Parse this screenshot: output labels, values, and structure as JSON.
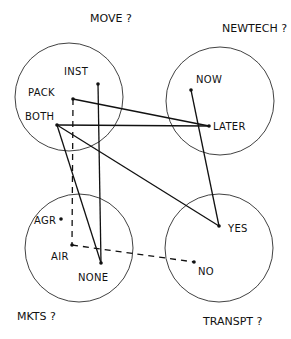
{
  "diagram": {
    "type": "hand-drawn-venn-network",
    "ink_color": "#111111",
    "background": "#ffffff",
    "groups": [
      {
        "id": "move",
        "title": "MOVE ?",
        "cx": 69,
        "cy": 97,
        "r": 54,
        "title_x": 90,
        "title_y": 22
      },
      {
        "id": "newtech",
        "title": "NEWTECH ?",
        "cx": 220,
        "cy": 101,
        "r": 54,
        "title_x": 222,
        "title_y": 32
      },
      {
        "id": "mkts",
        "title": "MKTS ?",
        "cx": 79,
        "cy": 248,
        "r": 54,
        "title_x": 17,
        "title_y": 320
      },
      {
        "id": "transpt",
        "title": "TRANSPT ?",
        "cx": 219,
        "cy": 248,
        "r": 54,
        "title_x": 203,
        "title_y": 325
      }
    ],
    "nodes": [
      {
        "id": "inst",
        "label": "INST",
        "x": 98,
        "y": 84,
        "lx": 64,
        "ly": 75,
        "group": "move"
      },
      {
        "id": "pack",
        "label": "PACK",
        "x": 73,
        "y": 99,
        "lx": 28,
        "ly": 96,
        "group": "move"
      },
      {
        "id": "both",
        "label": "BOTH",
        "x": 57,
        "y": 125,
        "lx": 25,
        "ly": 120,
        "group": "move"
      },
      {
        "id": "now",
        "label": "NOW",
        "x": 191,
        "y": 90,
        "lx": 196,
        "ly": 83,
        "group": "newtech"
      },
      {
        "id": "later",
        "label": "LATER",
        "x": 209,
        "y": 126,
        "lx": 213,
        "ly": 130,
        "group": "newtech"
      },
      {
        "id": "agr",
        "label": "AGR",
        "x": 61,
        "y": 219,
        "lx": 34,
        "ly": 224,
        "group": "mkts"
      },
      {
        "id": "air",
        "label": "AIR",
        "x": 72,
        "y": 245,
        "lx": 51,
        "ly": 260,
        "group": "mkts"
      },
      {
        "id": "none",
        "label": "NONE",
        "x": 101,
        "y": 263,
        "lx": 78,
        "ly": 281,
        "group": "mkts"
      },
      {
        "id": "yes",
        "label": "YES",
        "x": 219,
        "y": 226,
        "lx": 228,
        "ly": 232,
        "group": "transpt"
      },
      {
        "id": "no",
        "label": "NO",
        "x": 194,
        "y": 262,
        "lx": 198,
        "ly": 275,
        "group": "transpt"
      }
    ],
    "edges": [
      {
        "from": "inst",
        "to": "none",
        "style": "solid"
      },
      {
        "from": "pack",
        "to": "later",
        "style": "solid"
      },
      {
        "from": "pack",
        "to": "air",
        "style": "dashed"
      },
      {
        "from": "both",
        "to": "later",
        "style": "solid"
      },
      {
        "from": "both",
        "to": "yes",
        "style": "solid"
      },
      {
        "from": "both",
        "to": "none",
        "style": "solid"
      },
      {
        "from": "now",
        "to": "yes",
        "style": "solid"
      },
      {
        "from": "air",
        "to": "no",
        "style": "dashed"
      }
    ]
  }
}
